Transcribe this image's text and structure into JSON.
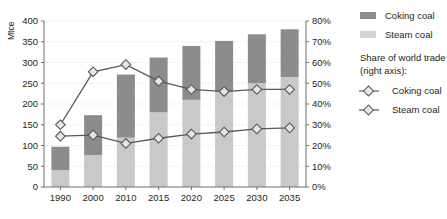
{
  "chart_data": {
    "type": "bar",
    "title": "",
    "xlabel": "",
    "ylabel": "Mtce",
    "ylabel_right": "",
    "categories": [
      "1990",
      "2000",
      "2010",
      "2015",
      "2020",
      "2025",
      "2030",
      "2035"
    ],
    "ylim": [
      0,
      400
    ],
    "ylim_right": [
      0,
      80
    ],
    "grid": true,
    "legend_position": "right",
    "stacked": true,
    "series": [
      {
        "name": "Steam coal",
        "kind": "bar",
        "axis": "left",
        "color": "#c9c9c9",
        "values": [
          41,
          77,
          119,
          180,
          210,
          230,
          250,
          265
        ]
      },
      {
        "name": "Coking coal",
        "kind": "bar",
        "axis": "left",
        "color": "#8c8c8c",
        "values": [
          56,
          96,
          152,
          132,
          130,
          122,
          118,
          115
        ]
      },
      {
        "name": "Coking coal",
        "kind": "line",
        "axis": "right",
        "color": "#58595b",
        "values": [
          30,
          55.5,
          59,
          51,
          47,
          46,
          47,
          47
        ]
      },
      {
        "name": "Steam coal",
        "kind": "line",
        "axis": "right",
        "color": "#58595b",
        "values": [
          24.5,
          25,
          21,
          23.5,
          25.5,
          26.5,
          28,
          28.5
        ]
      }
    ],
    "totals": [
      97,
      173,
      271,
      312,
      340,
      352,
      368,
      380
    ],
    "yticks": [
      "0",
      "50",
      "100",
      "150",
      "200",
      "250",
      "300",
      "350",
      "400"
    ],
    "yticks_right": [
      "0%",
      "10%",
      "20%",
      "30%",
      "40%",
      "50%",
      "60%",
      "70%",
      "80%"
    ]
  },
  "legend": {
    "bars": [
      {
        "label": "Coking coal",
        "color": "#8c8c8c"
      },
      {
        "label": "Steam coal",
        "color": "#d3d3d3"
      }
    ],
    "group_title_line1": "Share of world trade",
    "group_title_line2": "(right axis):",
    "lines": [
      {
        "label": "Coking coal",
        "color": "#58595b"
      },
      {
        "label": "Steam coal",
        "color": "#58595b"
      }
    ]
  }
}
